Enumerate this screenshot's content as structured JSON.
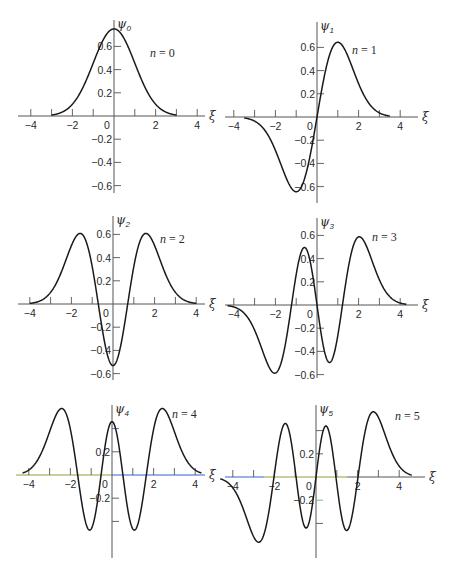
{
  "figure": {
    "x_axis_symbol": "ξ",
    "y_axis_symbol": "ψ",
    "x_scale_px_per_unit": 20.8,
    "y_scale_px_per_unit": 116,
    "curve_color": "#1a1a1a",
    "axis_color": "#555555",
    "axis_highlight_colors": {
      "olive": "#9a9a3a",
      "blue": "#3a5fd0",
      "green": "#5cc06a"
    }
  },
  "chart_data": [
    {
      "type": "line",
      "title": "n = 0",
      "n": 0,
      "ylabel": "ψ0",
      "xlabel": "ξ",
      "x_ticks": [
        -4,
        -3,
        -2,
        -1,
        0,
        1,
        2,
        3,
        4
      ],
      "x_tick_labels": [
        "−4",
        "−2",
        "0",
        "2",
        "4"
      ],
      "y_tick_labels": [
        "0.6",
        "0.4",
        "0.2",
        "−0.2",
        "−0.4",
        "−0.6"
      ],
      "xlim": [
        -4.3,
        4.5
      ],
      "ylim": [
        -0.65,
        0.8
      ],
      "x": [
        -3,
        -2.5,
        -2,
        -1.5,
        -1,
        -0.5,
        0,
        0.5,
        1,
        1.5,
        2,
        2.5,
        3
      ],
      "values": [
        0.0084,
        0.0332,
        0.1019,
        0.2438,
        0.4556,
        0.6292,
        0.7511,
        0.6629,
        0.4556,
        0.2438,
        0.1019,
        0.0332,
        0.0084
      ],
      "origin_px": [
        114,
        116
      ],
      "yaxis_px": [
        20,
        193
      ],
      "xaxis_px": [
        18,
        205
      ],
      "label_pos": [
        150,
        57
      ],
      "grid": false
    },
    {
      "type": "line",
      "title": "n = 1",
      "n": 1,
      "ylabel": "ψ1",
      "xlabel": "ξ",
      "x_ticks": [
        -4,
        -3,
        -2,
        -1,
        0,
        1,
        2,
        3,
        4
      ],
      "x_tick_labels": [
        "−4",
        "−2",
        "0",
        "2",
        "4"
      ],
      "y_tick_labels": [
        "0.6",
        "0.4",
        "0.2",
        "−0.2",
        "−0.4",
        "−0.6"
      ],
      "xlim": [
        -4.3,
        4.5
      ],
      "ylim": [
        -0.7,
        0.8
      ],
      "x": [
        -3.5,
        -3,
        -2.5,
        -2,
        -1.5,
        -1,
        -0.5,
        0,
        0.5,
        1,
        1.5,
        2,
        2.5,
        3,
        3.5
      ],
      "values": [
        -0.0094,
        -0.0355,
        -0.1174,
        -0.2883,
        -0.5172,
        -0.6443,
        -0.4707,
        0,
        0.4707,
        0.6443,
        0.5172,
        0.2883,
        0.1174,
        0.0355,
        0.0094
      ],
      "origin_px": [
        317,
        117
      ],
      "yaxis_px": [
        22,
        203
      ],
      "xaxis_px": [
        225,
        418
      ],
      "label_pos": [
        352,
        54
      ],
      "grid": false
    },
    {
      "type": "line",
      "title": "n = 2",
      "n": 2,
      "ylabel": "ψ2",
      "xlabel": "ξ",
      "x_ticks": [
        -4,
        -3,
        -2,
        -1,
        0,
        1,
        2,
        3,
        4
      ],
      "x_tick_labels": [
        "−4",
        "−2",
        "0",
        "2",
        "4"
      ],
      "y_tick_labels": [
        "0.6",
        "0.4",
        "0.2",
        "−0.2",
        "−0.4",
        "−0.6"
      ],
      "xlim": [
        -4.3,
        4.5
      ],
      "ylim": [
        -0.65,
        0.7
      ],
      "x": [
        -4,
        -3,
        -2,
        -1.5,
        -1,
        -0.5,
        0,
        0.5,
        1,
        1.5,
        2,
        3,
        4
      ],
      "values": [
        0.0013,
        0.0599,
        0.3118,
        0.6007,
        0.2278,
        -0.2657,
        -0.5311,
        -0.2657,
        0.2278,
        0.6007,
        0.3118,
        0.0599,
        0.0013
      ],
      "origin_px": [
        113,
        304
      ],
      "yaxis_px": [
        216,
        380
      ],
      "xaxis_px": [
        18,
        205
      ],
      "label_pos": [
        160,
        243
      ],
      "grid": false
    },
    {
      "type": "line",
      "title": "n = 3",
      "n": 3,
      "ylabel": "ψ3",
      "xlabel": "ξ",
      "x_ticks": [
        -4,
        -3,
        -2,
        -1,
        0,
        1,
        2,
        3,
        4
      ],
      "x_tick_labels": [
        "−4",
        "−2",
        "0",
        "2",
        "4"
      ],
      "y_tick_labels": [
        "0.6",
        "0.4",
        "0.2",
        "−0.2",
        "−0.4",
        "−0.6"
      ],
      "xlim": [
        -4.3,
        4.5
      ],
      "ylim": [
        -0.65,
        0.7
      ],
      "x": [
        -4,
        -3,
        -2,
        -1.5,
        -1,
        -0.5,
        0,
        0.5,
        1,
        1.5,
        2,
        3,
        4
      ],
      "values": [
        -0.0118,
        -0.1588,
        -0.5764,
        -0.4483,
        0.186,
        0.5035,
        0,
        -0.5035,
        -0.186,
        0.4483,
        0.5764,
        0.1588,
        0.0118
      ],
      "origin_px": [
        317,
        305
      ],
      "yaxis_px": [
        218,
        378
      ],
      "xaxis_px": [
        225,
        418
      ],
      "label_pos": [
        372,
        241
      ],
      "grid": false
    },
    {
      "type": "line",
      "title": "n = 4",
      "n": 4,
      "ylabel": "ψ4",
      "xlabel": "ξ",
      "x_ticks": [
        -4,
        -3,
        -2,
        -1,
        0,
        1,
        2,
        3,
        4
      ],
      "x_tick_labels": [
        "−4",
        "−2",
        "0",
        "2",
        "4"
      ],
      "y_tick_labels": [
        "0.2",
        "−0.2"
      ],
      "xlim": [
        -4.3,
        4.5
      ],
      "ylim": [
        -0.7,
        0.6
      ],
      "x": [
        -4,
        -3,
        -2.5,
        -2,
        -1.5,
        -1,
        -0.5,
        0,
        0.5,
        1,
        1.5,
        2,
        2.5,
        3,
        4
      ],
      "values": [
        0.0465,
        0.3103,
        0.5219,
        0.3765,
        -0.3062,
        -0.3939,
        0.1384,
        0.46,
        0.1384,
        -0.3939,
        -0.3062,
        0.3765,
        0.5219,
        0.3103,
        0.0465
      ],
      "origin_px": [
        112,
        475
      ],
      "yaxis_px": [
        405,
        558
      ],
      "xaxis_px": [
        16,
        205
      ],
      "label_pos": [
        172,
        418
      ],
      "grid": false
    },
    {
      "type": "line",
      "title": "n = 5",
      "n": 5,
      "ylabel": "ψ5",
      "xlabel": "ξ",
      "x_ticks": [
        -4,
        -3,
        -2,
        -1,
        0,
        1,
        2,
        3,
        4
      ],
      "x_tick_labels": [
        "−4",
        "−2",
        "0",
        "2",
        "4"
      ],
      "y_tick_labels": [
        "0.2",
        "−0.2"
      ],
      "xlim": [
        -4.3,
        4.7
      ],
      "ylim": [
        -0.7,
        0.6
      ],
      "x": [
        -4.5,
        -4,
        -3,
        -2.5,
        -2,
        -1.5,
        -1,
        -0.5,
        0,
        0.5,
        1,
        1.5,
        2,
        2.5,
        3,
        4,
        4.5
      ],
      "values": [
        -0.0327,
        -0.1479,
        -0.4856,
        -0.3551,
        0.0195,
        0.408,
        -0.0939,
        -0.3868,
        0,
        0.3868,
        0.0939,
        -0.408,
        -0.0195,
        0.3551,
        0.4856,
        0.1479,
        0.0327
      ],
      "origin_px": [
        316,
        477
      ],
      "yaxis_px": [
        405,
        558
      ],
      "xaxis_px": [
        225,
        425
      ],
      "label_pos": [
        395,
        420
      ],
      "grid": false
    }
  ],
  "labels": {
    "panels": [
      {
        "n_var": "n",
        "eq": " = 0",
        "psi": "ψ",
        "sub": "0"
      },
      {
        "n_var": "n",
        "eq": " = 1",
        "psi": "ψ",
        "sub": "1"
      },
      {
        "n_var": "n",
        "eq": " = 2",
        "psi": "ψ",
        "sub": "2"
      },
      {
        "n_var": "n",
        "eq": " = 3",
        "psi": "ψ",
        "sub": "3"
      },
      {
        "n_var": "n",
        "eq": " = 4",
        "psi": "ψ",
        "sub": "4"
      },
      {
        "n_var": "n",
        "eq": " = 5",
        "psi": "ψ",
        "sub": "5"
      }
    ]
  }
}
